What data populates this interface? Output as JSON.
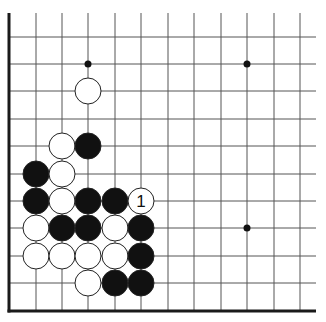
{
  "diagram": {
    "type": "go-board-fragment",
    "grid": {
      "columns_x": [
        9,
        36,
        62,
        88,
        115,
        141,
        168,
        194,
        221,
        247,
        274,
        300
      ],
      "rows_y": [
        37,
        64,
        91,
        119,
        146,
        174,
        201,
        228,
        256,
        283,
        311
      ],
      "left_edge_x": 9,
      "bottom_edge_y": 311,
      "line_top_y": 13,
      "line_right_x": 316,
      "line_color": "#555555",
      "edge_color": "#1a1a1a"
    },
    "stone_radius": 13,
    "hoshi": [
      {
        "col": 3,
        "row": 1
      },
      {
        "col": 9,
        "row": 1
      },
      {
        "col": 9,
        "row": 7
      }
    ],
    "stones": [
      {
        "color": "white",
        "col": 3,
        "row": 2
      },
      {
        "color": "white",
        "col": 2,
        "row": 4
      },
      {
        "color": "black",
        "col": 3,
        "row": 4
      },
      {
        "color": "black",
        "col": 1,
        "row": 5
      },
      {
        "color": "white",
        "col": 2,
        "row": 5
      },
      {
        "color": "black",
        "col": 1,
        "row": 6
      },
      {
        "color": "white",
        "col": 2,
        "row": 6
      },
      {
        "color": "black",
        "col": 3,
        "row": 6
      },
      {
        "color": "black",
        "col": 4,
        "row": 6
      },
      {
        "color": "white",
        "col": 5,
        "row": 6,
        "label": "1"
      },
      {
        "color": "white",
        "col": 1,
        "row": 7
      },
      {
        "color": "black",
        "col": 2,
        "row": 7
      },
      {
        "color": "black",
        "col": 3,
        "row": 7
      },
      {
        "color": "white",
        "col": 4,
        "row": 7
      },
      {
        "color": "black",
        "col": 5,
        "row": 7
      },
      {
        "color": "white",
        "col": 1,
        "row": 8
      },
      {
        "color": "white",
        "col": 2,
        "row": 8
      },
      {
        "color": "white",
        "col": 3,
        "row": 8
      },
      {
        "color": "white",
        "col": 4,
        "row": 8
      },
      {
        "color": "black",
        "col": 5,
        "row": 8
      },
      {
        "color": "white",
        "col": 3,
        "row": 9
      },
      {
        "color": "black",
        "col": 4,
        "row": 9
      },
      {
        "color": "black",
        "col": 5,
        "row": 9
      }
    ],
    "colors": {
      "black_stone": "#111111",
      "white_stone": "#ffffff",
      "stone_outline": "#222222",
      "label_text": "#111111",
      "background": "#ffffff"
    }
  }
}
